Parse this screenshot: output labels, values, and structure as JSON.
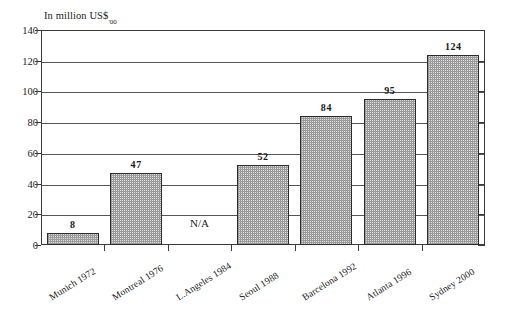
{
  "chart_data": {
    "type": "bar",
    "title": "In million US$'00",
    "title_main": "In million US$",
    "title_subscript": "'00",
    "xlabel": "",
    "ylabel": "In million US$'00",
    "categories": [
      "Munich 1972",
      "Montreal 1976",
      "L.Angeles 1984",
      "Seoul 1988",
      "Barcelona 1992",
      "Atlanta 1996",
      "Sydney 2000"
    ],
    "values": [
      8,
      47,
      null,
      52,
      84,
      95,
      124
    ],
    "value_labels": [
      "8",
      "47",
      "N/A",
      "52",
      "84",
      "95",
      "124"
    ],
    "missing_label": "N/A",
    "ylim": [
      0,
      140
    ],
    "yticks": [
      0,
      20,
      40,
      60,
      80,
      100,
      120,
      140
    ],
    "ytick_labels": [
      "0",
      "20",
      "40",
      "60",
      "80",
      "100",
      "120",
      "140"
    ],
    "grid": true,
    "grid_axis": "y",
    "legend": false,
    "legend_position": "none",
    "bar_fill": "#dedede",
    "bar_pattern": "fine-checker-dither",
    "bar_edge_color": "#2b2b2b",
    "axis_color": "#3a3a3a",
    "background": "#ffffff"
  }
}
